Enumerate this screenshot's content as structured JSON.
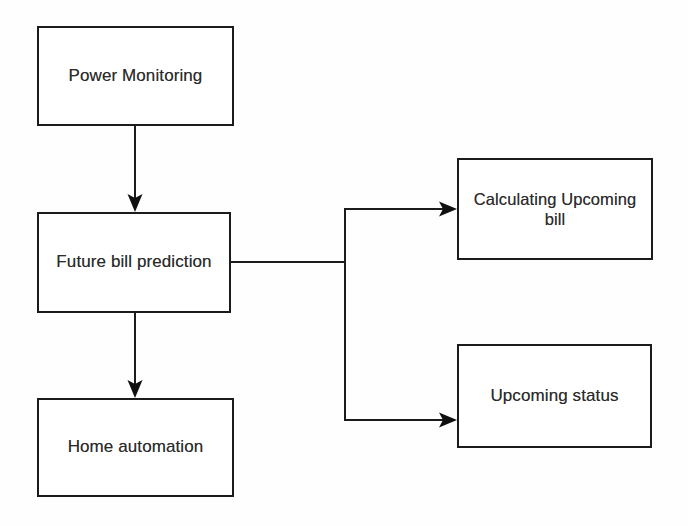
{
  "diagram": {
    "background_color": "#fefefe",
    "line_color": "#1b1b1b",
    "text_color": "#2b2b2b",
    "nodes": [
      {
        "id": "power-monitoring",
        "label": "Power Monitoring"
      },
      {
        "id": "future-bill-prediction",
        "label": "Future bill prediction"
      },
      {
        "id": "home-automation",
        "label": "Home automation"
      },
      {
        "id": "calculating-upcoming-bill",
        "label": "Calculating Upcoming\nbill"
      },
      {
        "id": "upcoming-status",
        "label": "Upcoming status"
      }
    ],
    "edges": [
      {
        "from": "power-monitoring",
        "to": "future-bill-prediction",
        "style": "straight-down",
        "arrow": true
      },
      {
        "from": "future-bill-prediction",
        "to": "home-automation",
        "style": "straight-down",
        "arrow": true
      },
      {
        "from": "future-bill-prediction",
        "to": "calculating-upcoming-bill",
        "style": "branch-up-right",
        "arrow": true
      },
      {
        "from": "future-bill-prediction",
        "to": "upcoming-status",
        "style": "branch-down-right",
        "arrow": true
      }
    ]
  }
}
